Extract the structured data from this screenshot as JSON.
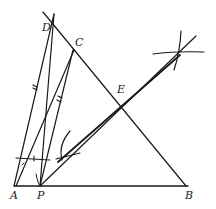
{
  "diagram": {
    "type": "geometric-construction",
    "colors": {
      "stroke": "#1a1a1a",
      "background": "#ffffff"
    },
    "points": [
      {
        "name": "D",
        "x": 53,
        "y": 27,
        "label_x": 42,
        "label_y": 31
      },
      {
        "name": "C",
        "x": 73,
        "y": 50,
        "label_x": 75,
        "label_y": 46
      },
      {
        "name": "E",
        "x": 122,
        "y": 97,
        "label_x": 117,
        "label_y": 93
      },
      {
        "name": "A",
        "x": 14,
        "y": 186,
        "label_x": 10,
        "label_y": 199
      },
      {
        "name": "P",
        "x": 40,
        "y": 186,
        "label_x": 37,
        "label_y": 199
      },
      {
        "name": "B",
        "x": 186,
        "y": 186,
        "label_x": 186,
        "label_y": 199
      }
    ],
    "labels": [
      "D",
      "C",
      "E",
      "A",
      "P",
      "B"
    ]
  }
}
